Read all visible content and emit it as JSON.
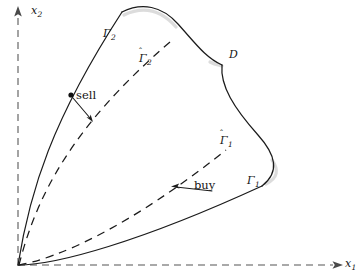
{
  "figure": {
    "type": "diagram",
    "background_color": "#ffffff",
    "stroke_color": "#1b1b1b",
    "axis_color": "#8d8d8d",
    "width": 363,
    "height": 279
  },
  "axes": {
    "origin": {
      "x": 18,
      "y": 265
    },
    "x_axis": {
      "label": "x",
      "subscript": "1",
      "style": "dashed",
      "arrow": "right"
    },
    "y_axis": {
      "label": "x",
      "subscript": "2",
      "style": "dashed",
      "arrow": "up"
    }
  },
  "labels": {
    "gamma2": {
      "text": "Γ",
      "subscript": "2",
      "hat": false,
      "name": "sell-boundary"
    },
    "gamma2_hat": {
      "text": "Γ",
      "subscript": "2",
      "hat": true,
      "name": "sell-boundary-approx"
    },
    "gamma1": {
      "text": "Γ",
      "subscript": "1",
      "hat": false,
      "name": "buy-boundary"
    },
    "gamma1_hat": {
      "text": "Γ",
      "subscript": "1",
      "hat": true,
      "name": "buy-boundary-approx"
    },
    "region": {
      "text": "D",
      "name": "no-transaction-region"
    },
    "sell_action": {
      "text": "sell",
      "name": "sell-annotation"
    },
    "buy_action": {
      "text": "buy",
      "name": "buy-annotation"
    }
  },
  "curves": {
    "gamma2": {
      "style": "solid",
      "path": "M 18 265 C 30 190 52 120 122 12",
      "note": "upper-left solid boundary from origin, convex to the left"
    },
    "gamma2_hat": {
      "style": "dashed",
      "path": "M 19 265 C 36 198 70 128 170 42",
      "note": "dashed curve just inside the sell boundary"
    },
    "top_arc": {
      "style": "solid",
      "path": "M 122 12 C 142 2 162 6 178 24 C 196 44 206 58 222 65",
      "note": "rounded cap connecting the sell boundary to the D cusp"
    },
    "cusp_right": {
      "style": "solid",
      "path": "M 222 65 C 220 86 234 108 258 135 C 276 155 280 172 262 186",
      "note": "right boundary descending from the D cusp with an outward bulge"
    },
    "gamma1": {
      "style": "solid",
      "path": "M 18 265 C 56 265 140 242 262 186",
      "note": "lower solid boundary from origin curving up to the right"
    },
    "gamma1_hat": {
      "style": "dashed",
      "path": "M 19 265 C 58 258 128 228 226 150",
      "note": "dashed curve just inside the buy boundary"
    }
  },
  "annotations": {
    "sell": {
      "dot": {
        "x": 71,
        "y": 95
      },
      "arrow_from": {
        "x": 73,
        "y": 98
      },
      "arrow_to": {
        "x": 92,
        "y": 120
      },
      "label_text": "sell"
    },
    "buy": {
      "arrow_from": {
        "x": 210,
        "y": 190
      },
      "arrow_to": {
        "x": 172,
        "y": 187
      },
      "label_text": "buy"
    }
  }
}
